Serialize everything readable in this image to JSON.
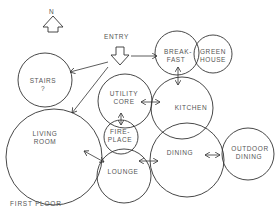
{
  "diagram": {
    "title": "FIRST FLOOR",
    "north_label": "N",
    "entry_label": "ENTRY",
    "rooms": [
      {
        "id": "stairs",
        "line1": "STAIRS",
        "line2": "?"
      },
      {
        "id": "living-room",
        "line1": "LIVING",
        "line2": "ROOM"
      },
      {
        "id": "utility-core",
        "line1": "UTILITY",
        "line2": "CORE"
      },
      {
        "id": "fireplace",
        "line1": "FIRE-",
        "line2": "PLACE"
      },
      {
        "id": "lounge",
        "line1": "LOUNGE",
        "line2": ""
      },
      {
        "id": "kitchen",
        "line1": "KITCHEN",
        "line2": ""
      },
      {
        "id": "breakfast",
        "line1": "BREAK-",
        "line2": "FAST"
      },
      {
        "id": "greenhouse",
        "line1": "GREEN",
        "line2": "HOUSE"
      },
      {
        "id": "dining",
        "line1": "DINING",
        "line2": ""
      },
      {
        "id": "outdoor-dining",
        "line1": "OUTDOOR",
        "line2": "DINING"
      }
    ],
    "connections": [
      [
        "entry",
        "stairs"
      ],
      [
        "entry",
        "living-room"
      ],
      [
        "entry",
        "breakfast"
      ],
      [
        "utility-core",
        "fireplace"
      ],
      [
        "utility-core",
        "kitchen"
      ],
      [
        "breakfast",
        "kitchen"
      ],
      [
        "living-room",
        "lounge"
      ],
      [
        "lounge",
        "dining"
      ],
      [
        "dining",
        "outdoor-dining"
      ]
    ],
    "colors": {
      "stroke": "#333333",
      "text": "#555555",
      "background": "#ffffff"
    }
  }
}
